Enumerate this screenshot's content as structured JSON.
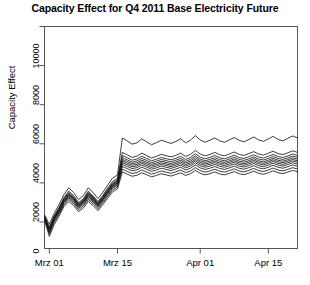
{
  "chart_data": {
    "type": "line",
    "title": "Capacity Effect for Q4 2011 Base Electricity Future",
    "xlabel": "",
    "ylabel": "Capacity Effect",
    "ylim": [
      0,
      10000
    ],
    "ytick_values": [
      0,
      2000,
      4000,
      6000,
      8000,
      10000
    ],
    "ytick_labels": [
      "0",
      "2000",
      "4000",
      "6000",
      "8000",
      "10000"
    ],
    "xtick_labels": [
      "Mrz 01",
      "Mrz 15",
      "Apr 01",
      "Apr 15"
    ],
    "xtick_positions": [
      1,
      15,
      32,
      46
    ],
    "xlim": [
      0,
      52
    ],
    "grid": false,
    "legend": false,
    "line_color": "#1a1a1a",
    "frame_color": "#555555",
    "background": "#ffffff",
    "x": [
      0,
      1,
      2,
      3,
      4,
      5,
      6,
      7,
      8,
      9,
      10,
      11,
      12,
      13,
      14,
      15,
      16,
      17,
      18,
      19,
      20,
      21,
      22,
      23,
      24,
      25,
      26,
      27,
      28,
      29,
      30,
      31,
      32,
      33,
      34,
      35,
      36,
      37,
      38,
      39,
      40,
      41,
      42,
      43,
      44,
      45,
      46,
      47,
      48,
      49,
      50,
      51,
      52
    ],
    "series": [
      {
        "name": "quantile-100",
        "values": [
          380,
          -120,
          450,
          900,
          1400,
          1750,
          1500,
          1150,
          1350,
          1750,
          1500,
          1200,
          1520,
          1900,
          2250,
          2400,
          4300,
          4150,
          3980,
          4050,
          4250,
          4100,
          3950,
          4060,
          4180,
          4100,
          4020,
          4120,
          4260,
          4050,
          4180,
          4420,
          4200,
          4080,
          4180,
          4300,
          4150,
          4080,
          4200,
          4320,
          4180,
          4100,
          4220,
          4350,
          4200,
          4120,
          4250,
          4380,
          4220,
          4150,
          4280,
          4400,
          4300
        ]
      },
      {
        "name": "quantile-90",
        "values": [
          300,
          -260,
          320,
          760,
          1250,
          1580,
          1340,
          1000,
          1190,
          1580,
          1330,
          1050,
          1370,
          1740,
          2080,
          2230,
          3560,
          3440,
          3300,
          3370,
          3520,
          3400,
          3270,
          3360,
          3460,
          3390,
          3330,
          3410,
          3520,
          3350,
          3460,
          3660,
          3480,
          3380,
          3460,
          3560,
          3440,
          3380,
          3480,
          3580,
          3460,
          3400,
          3500,
          3600,
          3480,
          3420,
          3520,
          3620,
          3500,
          3450,
          3540,
          3640,
          3560
        ]
      },
      {
        "name": "quantile-80",
        "values": [
          270,
          -320,
          270,
          700,
          1190,
          1510,
          1280,
          940,
          1130,
          1510,
          1270,
          990,
          1300,
          1670,
          2000,
          2150,
          3400,
          3290,
          3160,
          3220,
          3360,
          3250,
          3130,
          3210,
          3300,
          3240,
          3180,
          3260,
          3360,
          3200,
          3300,
          3490,
          3320,
          3230,
          3300,
          3400,
          3290,
          3230,
          3320,
          3420,
          3300,
          3250,
          3340,
          3440,
          3330,
          3270,
          3360,
          3460,
          3350,
          3300,
          3380,
          3480,
          3400
        ]
      },
      {
        "name": "quantile-70",
        "values": [
          250,
          -360,
          240,
          660,
          1150,
          1460,
          1240,
          900,
          1090,
          1460,
          1230,
          950,
          1260,
          1620,
          1950,
          2100,
          3290,
          3180,
          3060,
          3120,
          3250,
          3150,
          3030,
          3110,
          3200,
          3140,
          3080,
          3160,
          3250,
          3100,
          3200,
          3380,
          3220,
          3130,
          3200,
          3290,
          3190,
          3130,
          3220,
          3310,
          3200,
          3150,
          3230,
          3330,
          3220,
          3170,
          3250,
          3350,
          3250,
          3200,
          3280,
          3370,
          3300
        ]
      },
      {
        "name": "quantile-60",
        "values": [
          230,
          -390,
          210,
          630,
          1110,
          1420,
          1200,
          870,
          1060,
          1420,
          1200,
          920,
          1230,
          1580,
          1910,
          2060,
          3200,
          3090,
          2980,
          3030,
          3160,
          3060,
          2950,
          3020,
          3110,
          3050,
          2990,
          3070,
          3160,
          3020,
          3110,
          3290,
          3130,
          3050,
          3110,
          3200,
          3100,
          3050,
          3130,
          3220,
          3110,
          3060,
          3140,
          3240,
          3130,
          3080,
          3160,
          3260,
          3160,
          3110,
          3190,
          3280,
          3210
        ]
      },
      {
        "name": "quantile-50",
        "values": [
          215,
          -420,
          180,
          600,
          1080,
          1380,
          1170,
          840,
          1030,
          1380,
          1170,
          890,
          1200,
          1550,
          1880,
          2020,
          3120,
          3010,
          2900,
          2950,
          3080,
          2980,
          2870,
          2940,
          3030,
          2970,
          2910,
          2990,
          3080,
          2940,
          3030,
          3200,
          3050,
          2970,
          3030,
          3120,
          3020,
          2970,
          3050,
          3140,
          3030,
          2980,
          3060,
          3160,
          3050,
          3000,
          3080,
          3180,
          3080,
          3030,
          3110,
          3200,
          3130
        ]
      },
      {
        "name": "quantile-40",
        "values": [
          200,
          -450,
          150,
          570,
          1040,
          1340,
          1130,
          810,
          1000,
          1340,
          1130,
          860,
          1170,
          1510,
          1840,
          1980,
          3040,
          2930,
          2820,
          2870,
          3000,
          2900,
          2790,
          2860,
          2950,
          2890,
          2830,
          2910,
          3000,
          2860,
          2950,
          3120,
          2970,
          2890,
          2950,
          3040,
          2940,
          2890,
          2970,
          3060,
          2950,
          2900,
          2980,
          3080,
          2970,
          2920,
          3000,
          3100,
          3000,
          2950,
          3030,
          3120,
          3050
        ]
      },
      {
        "name": "quantile-30",
        "values": [
          180,
          -490,
          110,
          530,
          1000,
          1290,
          1080,
          770,
          960,
          1290,
          1080,
          820,
          1130,
          1460,
          1790,
          1930,
          2950,
          2840,
          2730,
          2780,
          2910,
          2810,
          2700,
          2770,
          2860,
          2800,
          2740,
          2820,
          2910,
          2770,
          2860,
          3030,
          2880,
          2800,
          2860,
          2950,
          2850,
          2800,
          2880,
          2970,
          2860,
          2810,
          2890,
          2990,
          2880,
          2830,
          2910,
          3010,
          2910,
          2860,
          2940,
          3030,
          2960
        ]
      },
      {
        "name": "quantile-20",
        "values": [
          160,
          -540,
          60,
          480,
          950,
          1230,
          1020,
          710,
          900,
          1230,
          1020,
          760,
          1070,
          1400,
          1730,
          1870,
          2840,
          2730,
          2620,
          2670,
          2800,
          2700,
          2590,
          2660,
          2750,
          2690,
          2630,
          2710,
          2800,
          2660,
          2750,
          2920,
          2770,
          2690,
          2750,
          2840,
          2740,
          2690,
          2770,
          2860,
          2750,
          2700,
          2780,
          2880,
          2770,
          2720,
          2800,
          2900,
          2800,
          2750,
          2830,
          2920,
          2850
        ]
      },
      {
        "name": "quantile-10",
        "values": [
          130,
          -620,
          -20,
          400,
          880,
          1150,
          940,
          630,
          820,
          1150,
          940,
          680,
          990,
          1320,
          1650,
          1790,
          2700,
          2590,
          2480,
          2530,
          2660,
          2560,
          2450,
          2520,
          2610,
          2550,
          2490,
          2570,
          2660,
          2520,
          2610,
          2780,
          2630,
          2550,
          2610,
          2700,
          2600,
          2550,
          2630,
          2720,
          2610,
          2560,
          2640,
          2740,
          2630,
          2580,
          2660,
          2760,
          2660,
          2610,
          2690,
          2780,
          2710
        ]
      },
      {
        "name": "quantile-0",
        "values": [
          90,
          -740,
          -130,
          300,
          790,
          1050,
          840,
          530,
          720,
          1050,
          840,
          580,
          890,
          1220,
          1550,
          1690,
          2560,
          2450,
          2340,
          2390,
          2520,
          2420,
          2310,
          2380,
          2470,
          2410,
          2350,
          2430,
          2520,
          2380,
          2470,
          2640,
          2490,
          2410,
          2470,
          2560,
          2460,
          2410,
          2490,
          2580,
          2470,
          2420,
          2500,
          2600,
          2490,
          2440,
          2520,
          2620,
          2520,
          2470,
          2550,
          2640,
          2570
        ]
      }
    ]
  }
}
